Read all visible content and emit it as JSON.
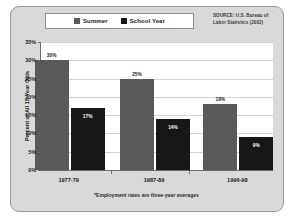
{
  "legend": {
    "entries": [
      {
        "label": "Summer",
        "color": "#595959",
        "icon": "legend-swatch-summer"
      },
      {
        "label": "School Year",
        "color": "#171717",
        "icon": "legend-swatch-school-year"
      }
    ]
  },
  "source": {
    "line1": "SOURCE: U.S. Bureau of",
    "line2": "Labor Statistics (2002)"
  },
  "footnote": "*Employment rates are three-year averages",
  "chart_data": {
    "type": "bar",
    "title": "",
    "xlabel": "",
    "ylabel": "Percent of All 15-Year Olds",
    "categories": [
      "1977-79",
      "1987-89",
      "1996-98"
    ],
    "series": [
      {
        "name": "Summer",
        "color": "#595959",
        "values": [
          30,
          25,
          18
        ],
        "labels": [
          "30%",
          "25%",
          "18%"
        ]
      },
      {
        "name": "School Year",
        "color": "#171717",
        "values": [
          17,
          14,
          9
        ],
        "labels": [
          "17%",
          "14%",
          "9%"
        ]
      }
    ],
    "ylim": [
      0,
      35
    ],
    "yticks": [
      0,
      5,
      10,
      15,
      20,
      25,
      30,
      35
    ],
    "ytick_labels": [
      "0%",
      "5%",
      "10%",
      "15%",
      "20%",
      "25%",
      "30%",
      "35%"
    ],
    "grid": true,
    "legend_position": "top-center"
  }
}
